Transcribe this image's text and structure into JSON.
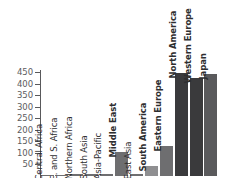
{
  "chart_data": {
    "type": "bar",
    "title": "",
    "subtitle": "",
    "xlabel": "",
    "ylabel": "",
    "ylim": [
      0,
      460
    ],
    "grid": false,
    "legend": null,
    "y_ticks": [
      450,
      400,
      350,
      300,
      250,
      200,
      150,
      100,
      50
    ],
    "y_tick_labels": [
      "450",
      "400",
      "350",
      "300",
      "250",
      "200",
      "150",
      "100",
      "50"
    ],
    "categories": [
      "Central Africa",
      "E. and S. Africa",
      "Northern Africa",
      "South Asia",
      "Asia-Pacific",
      "Middle East",
      "East Asia",
      "South America",
      "Eastern Europe",
      "North America",
      "Western Europe",
      "Japan"
    ],
    "values": [
      3,
      4,
      6,
      5,
      8,
      101,
      7,
      40,
      128,
      445,
      425,
      440
    ],
    "bar_colors": [
      "#6e6e70",
      "#6e6e70",
      "#6e6e70",
      "#6e6e70",
      "#6e6e70",
      "#6e6e70",
      "#6e6e70",
      "#8f8f91",
      "#6e6e70",
      "#3a3a3c",
      "#3a3a3c",
      "#5a5a5c"
    ],
    "label_bold": [
      false,
      false,
      false,
      false,
      false,
      true,
      false,
      true,
      true,
      true,
      true,
      true
    ],
    "axis_color": "#59595b",
    "tick_label_color": "#5c5c5e",
    "category_label_color": "#2e2e30",
    "background_color": "#ffffff",
    "note": "Figure is cropped: category labels and the chart baseline extend below the visible area; no zero tick is shown."
  }
}
